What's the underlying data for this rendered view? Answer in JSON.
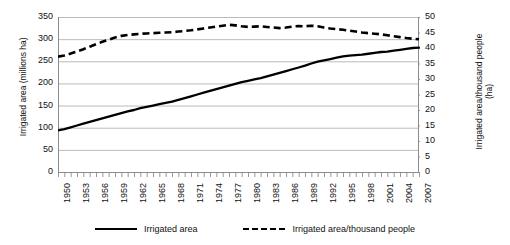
{
  "chart_data": {
    "type": "line",
    "title": "",
    "xlabel": "",
    "grid": true,
    "legend_position": "bottom",
    "x": [
      1950,
      1951,
      1952,
      1953,
      1954,
      1955,
      1956,
      1957,
      1958,
      1959,
      1960,
      1961,
      1962,
      1963,
      1964,
      1965,
      1966,
      1967,
      1968,
      1969,
      1970,
      1971,
      1972,
      1973,
      1974,
      1975,
      1976,
      1977,
      1978,
      1979,
      1980,
      1981,
      1982,
      1983,
      1984,
      1985,
      1986,
      1987,
      1988,
      1989,
      1990,
      1991,
      1992,
      1993,
      1994,
      1995,
      1996,
      1997,
      1998,
      1999,
      2000,
      2001,
      2002,
      2003,
      2004,
      2005,
      2006,
      2007
    ],
    "xtick_labels": [
      "1950",
      "1953",
      "1956",
      "1959",
      "1962",
      "1965",
      "1968",
      "1971",
      "1974",
      "1977",
      "1980",
      "1983",
      "1986",
      "1989",
      "1992",
      "1995",
      "1998",
      "2001",
      "2004",
      "2007"
    ],
    "xtick_step_years": 3,
    "axes": [
      {
        "id": "left",
        "label": "Irrigated area (millions ha)",
        "lim": [
          0,
          350
        ],
        "ticks": [
          0,
          50,
          100,
          150,
          200,
          250,
          300,
          350
        ],
        "unit": "millions ha"
      },
      {
        "id": "right",
        "label": "Irrigated area/thousand people\n(ha)",
        "lim": [
          0,
          50
        ],
        "ticks": [
          0,
          5,
          10,
          15,
          20,
          25,
          30,
          35,
          40,
          45,
          50
        ],
        "unit": "ha"
      }
    ],
    "series": [
      {
        "name": "Irrigated area",
        "axis": "left",
        "style": "solid",
        "color": "#000000",
        "values": [
          94,
          97,
          101,
          105,
          109,
          113,
          117,
          121,
          125,
          129,
          133,
          137,
          140,
          144,
          147,
          150,
          153,
          156,
          159,
          163,
          167,
          171,
          175,
          179,
          183,
          187,
          191,
          195,
          199,
          203,
          206,
          209,
          212,
          216,
          220,
          224,
          228,
          232,
          236,
          240,
          245,
          249,
          252,
          255,
          258,
          261,
          263,
          264,
          265,
          267,
          269,
          271,
          272,
          274,
          276,
          278,
          280,
          281
        ]
      },
      {
        "name": "Irrigated area/thousand people",
        "axis": "right",
        "style": "dashed",
        "color": "#000000",
        "values": [
          37.2,
          37.6,
          38.2,
          38.9,
          39.6,
          40.4,
          41.2,
          42.0,
          42.7,
          43.4,
          43.9,
          44.2,
          44.4,
          44.6,
          44.7,
          44.8,
          44.9,
          45.0,
          45.1,
          45.3,
          45.5,
          45.7,
          46.0,
          46.3,
          46.6,
          46.9,
          47.2,
          47.5,
          47.3,
          47.0,
          46.8,
          46.9,
          47.0,
          46.8,
          46.6,
          46.4,
          46.6,
          46.9,
          47.1,
          47.0,
          47.2,
          47.0,
          46.6,
          46.3,
          46.1,
          45.9,
          45.6,
          45.3,
          45.0,
          44.8,
          44.6,
          44.4,
          44.1,
          43.8,
          43.5,
          43.2,
          43.0,
          42.8
        ]
      }
    ]
  },
  "legend": {
    "items": [
      {
        "label": "Irrigated area",
        "style": "solid"
      },
      {
        "label": "Irrigated area/thousand people",
        "style": "dashed"
      }
    ]
  }
}
